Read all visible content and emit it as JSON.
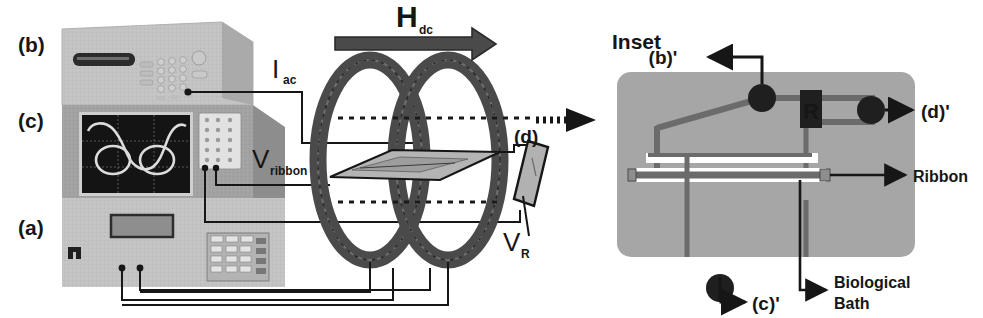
{
  "figure": {
    "background_color": "#ffffff",
    "ink_color": "#161616",
    "panel_fill": "#9e9e9e",
    "instrument_light": "#c3c3c3",
    "instrument_mid": "#a8a8a8",
    "instrument_dark": "#8a8a8a",
    "screen_color": "#141414",
    "trace_color": "#d8d8d8",
    "coil_color": "#4d4d4d"
  },
  "left_panel": {
    "name": "instrument-stack",
    "labels": [
      {
        "id": "b",
        "text": "(b)",
        "role": "function-generator-callout"
      },
      {
        "id": "c",
        "text": "(c)",
        "role": "oscilloscope-callout"
      },
      {
        "id": "a",
        "text": "(a)",
        "role": "lock-in-amplifier-callout"
      }
    ],
    "scope": {
      "name": "oscilloscope-screen",
      "grid_cols": 3,
      "grid_rows": 3,
      "trace": "hysteresis-lissajous-curve"
    }
  },
  "wiring": {
    "labels": [
      {
        "id": "i_ac",
        "base": "I",
        "sub": "ac",
        "role": "drive-current-lead"
      },
      {
        "id": "v_ribbon",
        "base": "V",
        "sub": "ribbon",
        "role": "ribbon-voltage-lead"
      },
      {
        "id": "v_r",
        "base": "V",
        "sub": "R",
        "role": "resistor-voltage-lead"
      }
    ]
  },
  "coils": {
    "name": "helmholtz-coil-pair",
    "field_label": {
      "base": "H",
      "sub": "dc",
      "role": "dc-bias-field"
    },
    "field_arrow_direction": "right",
    "sample_label": "magnetoelastic-ribbon-plate",
    "probe": {
      "id": "d",
      "text": "(d)",
      "role": "bath-cell-callout"
    }
  },
  "transition": {
    "name": "inset-pointer-arrow",
    "style": "dashed"
  },
  "inset": {
    "title": "Inset",
    "callouts": [
      {
        "id": "b_prime",
        "text": "(b)'",
        "direction": "left",
        "role": "drive-source-terminal"
      },
      {
        "id": "d_prime",
        "text": "(d)'",
        "direction": "right",
        "role": "resistor-terminal"
      },
      {
        "id": "c_prime",
        "text": "(c)'",
        "direction": "down",
        "role": "scope-terminal"
      }
    ],
    "annotations": [
      {
        "id": "ribbon",
        "text": "Ribbon",
        "direction": "right"
      },
      {
        "id": "bath",
        "text": "Biological\nBath",
        "line1": "Biological",
        "line2": "Bath",
        "direction": "down"
      }
    ],
    "resistor": {
      "label": "R",
      "role": "series-sense-resistor"
    }
  }
}
